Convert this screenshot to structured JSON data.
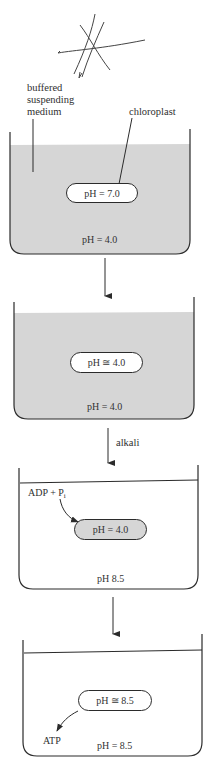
{
  "figure": {
    "labels": {
      "buffered_medium": [
        "buffered",
        "suspending",
        "medium"
      ],
      "chloroplast": "chloroplast",
      "alkali": "alkali",
      "adp": "ADP + P",
      "adp_sub": "i",
      "atp": "ATP"
    },
    "colors": {
      "medium_grey": "#d6d6d6",
      "line": "#2b2b2b",
      "background": "#ffffff"
    },
    "panels": [
      {
        "step": 1,
        "medium_shaded": true,
        "chloroplast_shaded": false,
        "chloroplast_ph": "pH = 7.0",
        "medium_ph": "pH = 4.0"
      },
      {
        "step": 2,
        "medium_shaded": true,
        "chloroplast_shaded": false,
        "chloroplast_ph": "pH ≅ 4.0",
        "medium_ph": "pH = 4.0"
      },
      {
        "step": 3,
        "medium_shaded": false,
        "chloroplast_shaded": true,
        "chloroplast_ph": "pH = 4.0",
        "medium_ph": "pH 8.5"
      },
      {
        "step": 4,
        "medium_shaded": false,
        "chloroplast_shaded": false,
        "chloroplast_ph": "pH ≅ 8.5",
        "medium_ph": "pH = 8.5"
      }
    ],
    "arrows": [
      {
        "from": 1,
        "to": 2,
        "label": ""
      },
      {
        "from": 2,
        "to": 3,
        "label": "alkali"
      },
      {
        "from": 3,
        "to": 4,
        "label": ""
      }
    ]
  }
}
